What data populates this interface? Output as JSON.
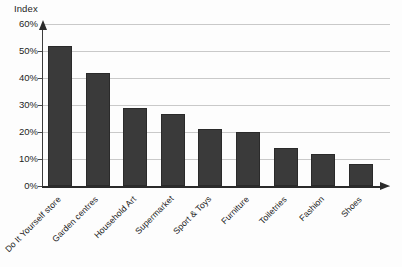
{
  "chart_data": {
    "type": "bar",
    "title": "",
    "subtitle": "",
    "ylabel": "Index",
    "xlabel": "",
    "categories": [
      "Do It Yourself store",
      "Garden centres",
      "Household Art",
      "Supermarket",
      "Sport & Toys",
      "Furniture",
      "Toiletries",
      "Fashion",
      "Shoes"
    ],
    "values": [
      52,
      42,
      29,
      26.5,
      21,
      20,
      14,
      12,
      8
    ],
    "value_labels": [
      "52%",
      "42%",
      "29%",
      "26.5%",
      "21%",
      "20%",
      "14%",
      "12%",
      "8%"
    ],
    "ylim": [
      0,
      60
    ],
    "ytick_values": [
      0,
      10,
      20,
      30,
      40,
      50,
      60
    ],
    "ytick_labels": [
      "0%",
      "10%",
      "20%",
      "30%",
      "40%",
      "50%",
      "60%"
    ],
    "grid": true,
    "grid_axis": "y",
    "legend": false,
    "legend_position": "none",
    "bar_color": "#3a3a3a",
    "grid_color": "#c9c9c9",
    "axis_color": "#2b2b2b",
    "background_color": "#fdfdfd",
    "xtick_label_rotation": -45,
    "series": [
      {
        "name": "Index",
        "values": [
          52,
          42,
          29,
          26.5,
          21,
          20,
          14,
          12,
          8
        ]
      }
    ]
  }
}
